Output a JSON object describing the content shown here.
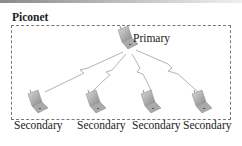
{
  "title": "Piconet",
  "primary": {
    "label": "Primary"
  },
  "secondaries": [
    {
      "label": "Secondary"
    },
    {
      "label": "Secondary"
    },
    {
      "label": "Secondary"
    },
    {
      "label": "Secondary"
    }
  ],
  "colors": {
    "frame": "#777777",
    "laptop": "#9a9a9a",
    "link": "#aaaaaa",
    "text": "#222222"
  }
}
